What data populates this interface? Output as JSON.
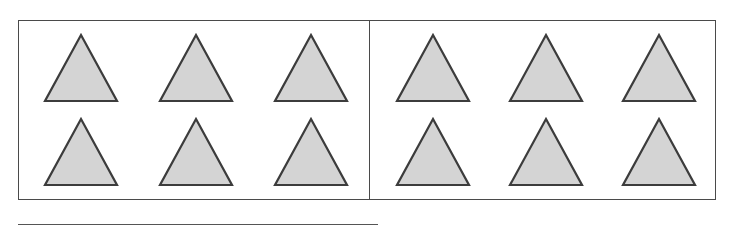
{
  "figure": {
    "type": "grouping-diagram",
    "total_shapes": 12,
    "shape_name": "triangle",
    "panel_count": 2
  },
  "colors": {
    "shape_fill": "#d4d4d4",
    "shape_stroke": "#3c3c3c",
    "box_border": "#4a4a4a",
    "rule": "#555555",
    "background": "#ffffff"
  },
  "panels": [
    {
      "id": "left-panel",
      "label": "",
      "shape_count": 6,
      "rows": [
        {
          "id": "left-row-1",
          "shapes": [
            "triangle",
            "triangle",
            "triangle"
          ]
        },
        {
          "id": "left-row-2",
          "shapes": [
            "triangle",
            "triangle",
            "triangle"
          ]
        }
      ]
    },
    {
      "id": "right-panel",
      "label": "",
      "shape_count": 6,
      "rows": [
        {
          "id": "right-row-1",
          "shapes": [
            "triangle",
            "triangle",
            "triangle"
          ]
        },
        {
          "id": "right-row-2",
          "shapes": [
            "triangle",
            "triangle",
            "triangle"
          ]
        }
      ]
    }
  ],
  "rule": {
    "id": "bottom-rule",
    "label": ""
  }
}
